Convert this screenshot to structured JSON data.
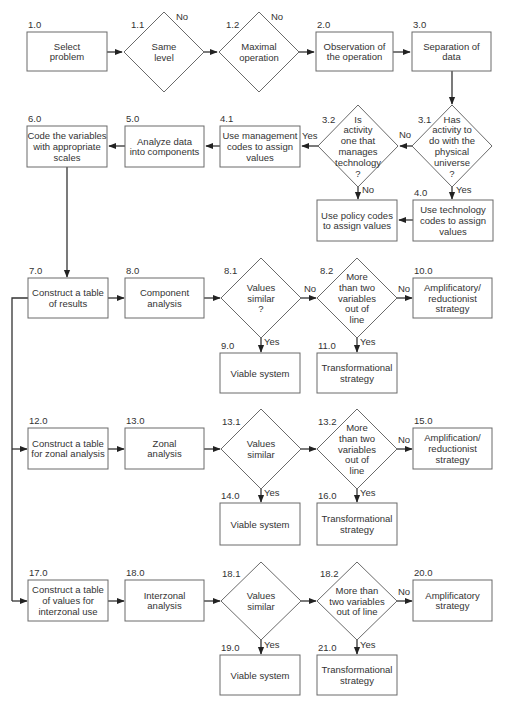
{
  "nodes": [
    {
      "id": "1.0",
      "shape": "box",
      "lines": [
        "Select",
        "problem"
      ]
    },
    {
      "id": "1.1",
      "shape": "diamond",
      "lines": [
        "Same",
        "level"
      ]
    },
    {
      "id": "1.2",
      "shape": "diamond",
      "lines": [
        "Maximal",
        "operation"
      ]
    },
    {
      "id": "2.0",
      "shape": "box",
      "lines": [
        "Observation of",
        "the operation"
      ]
    },
    {
      "id": "3.0",
      "shape": "box",
      "lines": [
        "Separation of",
        "data"
      ]
    },
    {
      "id": "3.1",
      "shape": "diamond",
      "lines": [
        "Has",
        "activity to",
        "do with the",
        "physical",
        "universe",
        "?"
      ]
    },
    {
      "id": "3.2",
      "shape": "diamond",
      "lines": [
        "Is",
        "activity",
        "one that",
        "manages",
        "technology",
        "?"
      ]
    },
    {
      "id": "4.0",
      "shape": "box",
      "lines": [
        "Use technology",
        "codes to assign",
        "values"
      ]
    },
    {
      "id": "policy",
      "shape": "box",
      "lines": [
        "Use policy codes",
        "to assign values"
      ]
    },
    {
      "id": "4.1",
      "shape": "box",
      "lines": [
        "Use management",
        "codes to assign",
        "values"
      ]
    },
    {
      "id": "5.0",
      "shape": "box",
      "lines": [
        "Analyze data",
        "into components"
      ]
    },
    {
      "id": "6.0",
      "shape": "box",
      "lines": [
        "Code the variables",
        "with appropriate",
        "scales"
      ]
    },
    {
      "id": "7.0",
      "shape": "box",
      "lines": [
        "Construct a table",
        "of results"
      ]
    },
    {
      "id": "8.0",
      "shape": "box",
      "lines": [
        "Component",
        "analysis"
      ]
    },
    {
      "id": "8.1",
      "shape": "diamond",
      "lines": [
        "Values",
        "similar",
        "?"
      ]
    },
    {
      "id": "8.2",
      "shape": "diamond",
      "lines": [
        "More",
        "than two",
        "variables",
        "out of",
        "line"
      ]
    },
    {
      "id": "9.0",
      "shape": "box",
      "lines": [
        "Viable system"
      ]
    },
    {
      "id": "10.0",
      "shape": "box",
      "lines": [
        "Amplificatory/",
        "reductionist",
        "strategy"
      ]
    },
    {
      "id": "11.0",
      "shape": "box",
      "lines": [
        "Transformational",
        "strategy"
      ]
    },
    {
      "id": "12.0",
      "shape": "box",
      "lines": [
        "Construct a table",
        "for zonal analysis"
      ]
    },
    {
      "id": "13.0",
      "shape": "box",
      "lines": [
        "Zonal",
        "analysis"
      ]
    },
    {
      "id": "13.1",
      "shape": "diamond",
      "lines": [
        "Values",
        "similar"
      ]
    },
    {
      "id": "13.2",
      "shape": "diamond",
      "lines": [
        "More",
        "than two",
        "variables",
        "out of",
        "line"
      ]
    },
    {
      "id": "14.0",
      "shape": "box",
      "lines": [
        "Viable system"
      ]
    },
    {
      "id": "15.0",
      "shape": "box",
      "lines": [
        "Amplification/",
        "reductionist",
        "strategy"
      ]
    },
    {
      "id": "16.0",
      "shape": "box",
      "lines": [
        "Transformational",
        "strategy"
      ]
    },
    {
      "id": "17.0",
      "shape": "box",
      "lines": [
        "Construct a table",
        "of values for",
        "interzonal use"
      ]
    },
    {
      "id": "18.0",
      "shape": "box",
      "lines": [
        "Interzonal",
        "analysis"
      ]
    },
    {
      "id": "18.1",
      "shape": "diamond",
      "lines": [
        "Values",
        "similar"
      ]
    },
    {
      "id": "18.2",
      "shape": "diamond",
      "lines": [
        "More than",
        "two variables",
        "out of line"
      ]
    },
    {
      "id": "19.0",
      "shape": "box",
      "lines": [
        "Viable system"
      ]
    },
    {
      "id": "20.0",
      "shape": "box",
      "lines": [
        "Amplificatory",
        "strategy"
      ]
    },
    {
      "id": "21.0",
      "shape": "box",
      "lines": [
        "Transformational",
        "strategy"
      ]
    }
  ],
  "edges": [
    {
      "from": "1.0",
      "to": "1.1",
      "label": ""
    },
    {
      "from": "1.1",
      "to": "1.2",
      "label": ""
    },
    {
      "from": "1.1",
      "to": "exit",
      "label": "No"
    },
    {
      "from": "1.2",
      "to": "2.0",
      "label": ""
    },
    {
      "from": "1.2",
      "to": "exit",
      "label": "No"
    },
    {
      "from": "2.0",
      "to": "3.0",
      "label": ""
    },
    {
      "from": "3.0",
      "to": "3.1",
      "label": ""
    },
    {
      "from": "3.1",
      "to": "3.2",
      "label": "No"
    },
    {
      "from": "3.1",
      "to": "4.0",
      "label": "Yes"
    },
    {
      "from": "3.2",
      "to": "4.1",
      "label": "Yes"
    },
    {
      "from": "3.2",
      "to": "policy",
      "label": "No"
    },
    {
      "from": "4.0",
      "to": "policy",
      "label": ""
    },
    {
      "from": "4.1",
      "to": "5.0",
      "label": ""
    },
    {
      "from": "5.0",
      "to": "6.0",
      "label": ""
    },
    {
      "from": "6.0",
      "to": "7.0",
      "label": ""
    },
    {
      "from": "7.0",
      "to": "8.0",
      "label": ""
    },
    {
      "from": "8.0",
      "to": "8.1",
      "label": ""
    },
    {
      "from": "8.1",
      "to": "8.2",
      "label": "No"
    },
    {
      "from": "8.1",
      "to": "9.0",
      "label": "Yes"
    },
    {
      "from": "8.2",
      "to": "10.0",
      "label": "No"
    },
    {
      "from": "8.2",
      "to": "11.0",
      "label": "Yes"
    },
    {
      "from": "7.0",
      "to": "12.0",
      "label": ""
    },
    {
      "from": "12.0",
      "to": "13.0",
      "label": ""
    },
    {
      "from": "13.0",
      "to": "13.1",
      "label": ""
    },
    {
      "from": "13.1",
      "to": "13.2",
      "label": ""
    },
    {
      "from": "13.1",
      "to": "14.0",
      "label": "Yes"
    },
    {
      "from": "13.2",
      "to": "15.0",
      "label": "No"
    },
    {
      "from": "13.2",
      "to": "16.0",
      "label": "Yes"
    },
    {
      "from": "7.0",
      "to": "17.0",
      "label": ""
    },
    {
      "from": "17.0",
      "to": "18.0",
      "label": ""
    },
    {
      "from": "18.0",
      "to": "18.1",
      "label": ""
    },
    {
      "from": "18.1",
      "to": "18.2",
      "label": ""
    },
    {
      "from": "18.1",
      "to": "19.0",
      "label": "Yes"
    },
    {
      "from": "18.2",
      "to": "20.0",
      "label": "No"
    },
    {
      "from": "18.2",
      "to": "21.0",
      "label": "Yes"
    }
  ],
  "labels": {
    "yes": "Yes",
    "no": "No"
  },
  "colors": {
    "stroke": "#6a6a6a",
    "line": "#333333",
    "text": "#333333",
    "background": "#ffffff"
  }
}
